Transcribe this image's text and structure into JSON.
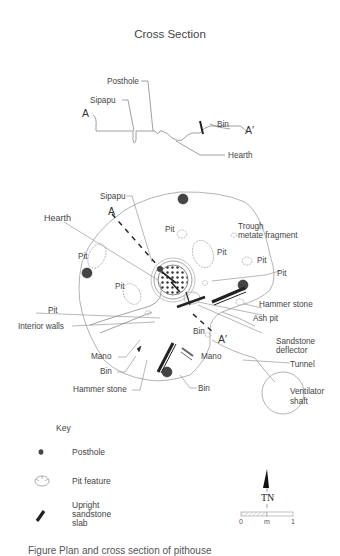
{
  "title": "Cross Section",
  "cross_section": {
    "labels": {
      "posthole": "Posthole",
      "sipapu": "Sipapu",
      "a": "A",
      "a_prime": "A′",
      "bin": "Bin",
      "hearth": "Hearth"
    }
  },
  "plan": {
    "labels": {
      "sipapu": "Sipapu",
      "hearth": "Hearth",
      "a": "A",
      "a_prime": "A′",
      "trough_line1": "Trough",
      "trough_line2": "metate fragment",
      "pit_upper_left": "Pit",
      "pit_center_left": "Pit",
      "pit_upper_center": "Pit",
      "pit_right_upper": "Pit",
      "pit_right_lower": "Pit",
      "pit_left_lower": "Pit",
      "interior_walls": "Interior walls",
      "mano_left": "Mano",
      "bin_left": "Bin",
      "hammer_stone_left": "Hammer stone",
      "hammer_stone_right": "Hammer stone",
      "ash_pit": "Ash pit",
      "bin_center": "Bin",
      "sandstone_line1": "Sandstone",
      "sandstone_line2": "deflector",
      "mano_right": "Mano",
      "tunnel": "Tunnel",
      "bin_bottom": "Bin",
      "ventilator_line1": "Ventilator",
      "ventilator_line2": "shaft"
    }
  },
  "key": {
    "title": "Key",
    "items": [
      {
        "icon": "posthole-icon",
        "label": "Posthole"
      },
      {
        "icon": "pit-feature-icon",
        "label": "Pit feature"
      },
      {
        "icon": "sandstone-slab-icon",
        "label_lines": [
          "Upright",
          "sandstone",
          "slab"
        ]
      }
    ]
  },
  "north_arrow": {
    "label": "TN"
  },
  "scale_bar": {
    "min": "0",
    "unit": "m",
    "max": "1"
  },
  "caption": "Figure  Plan and cross section of pithouse"
}
